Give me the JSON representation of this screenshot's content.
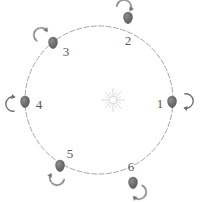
{
  "figure": {
    "type": "orbit-diagram",
    "background_color": "#ffffff",
    "orbit": {
      "name": "orbit-path",
      "style": "dashed",
      "stroke_color": "#8a8a8a",
      "center": {
        "x": 99,
        "y": 100
      },
      "radius": 74
    },
    "center_body": {
      "name": "sun",
      "label": "",
      "x": 113,
      "y": 100,
      "color": "#c9c9c9",
      "ray_count": 16
    },
    "body_color": "#6d6d6d",
    "label_color": "#585858",
    "arrow_color": "#6d6d6d",
    "rotation_direction": "counterclockwise",
    "positions": [
      {
        "label": "1",
        "body_x": 172,
        "body_y": 101,
        "label_x": 160,
        "label_y": 105,
        "arrow_cx": 186,
        "arrow_cy": 101,
        "arrow_rotation": 0
      },
      {
        "label": "2",
        "body_x": 128,
        "body_y": 17,
        "label_x": 128,
        "label_y": 42,
        "arrow_cx": 124,
        "arrow_cy": 7,
        "arrow_rotation": 285
      },
      {
        "label": "3",
        "body_x": 53,
        "body_y": 42,
        "label_x": 66,
        "label_y": 53,
        "arrow_cx": 41,
        "arrow_cy": 35,
        "arrow_rotation": 225
      },
      {
        "label": "4",
        "body_x": 25,
        "body_y": 101,
        "label_x": 39,
        "label_y": 106,
        "arrow_cx": 13,
        "arrow_cy": 104,
        "arrow_rotation": 180
      },
      {
        "label": "5",
        "body_x": 60,
        "body_y": 165,
        "label_x": 70,
        "label_y": 155,
        "arrow_cx": 57,
        "arrow_cy": 178,
        "arrow_rotation": 110
      },
      {
        "label": "6",
        "body_x": 133,
        "body_y": 182,
        "label_x": 131,
        "label_y": 168,
        "arrow_cx": 139,
        "arrow_cy": 192,
        "arrow_rotation": 35
      }
    ]
  }
}
